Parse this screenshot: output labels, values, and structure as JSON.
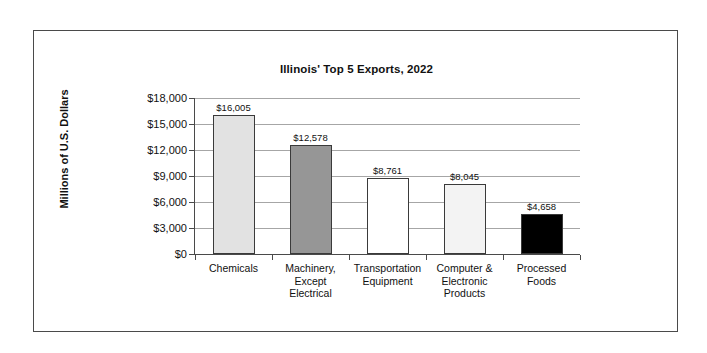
{
  "chart_data": {
    "type": "bar",
    "title": "Illinois' Top 5 Exports, 2022",
    "xlabel": "",
    "ylabel": "Millions of U.S. Dollars",
    "ylim": [
      0,
      18000
    ],
    "ytick_step": 3000,
    "grid": true,
    "legend": "none",
    "categories": [
      "Chemicals",
      "Machinery, Except Electrical",
      "Transportation Equipment",
      "Computer & Electronic Products",
      "Processed Foods"
    ],
    "category_lines": [
      [
        "Chemicals"
      ],
      [
        "Machinery,",
        "Except",
        "Electrical"
      ],
      [
        "Transportation",
        "Equipment"
      ],
      [
        "Computer &",
        "Electronic",
        "Products"
      ],
      [
        "Processed",
        "Foods"
      ]
    ],
    "values": [
      16005,
      12578,
      8761,
      8045,
      4658
    ],
    "value_labels": [
      "$16,005",
      "$12,578",
      "$8,761",
      "$8,045",
      "$4,658"
    ],
    "bar_colors": [
      "#e2e2e2",
      "#969696",
      "#ffffff",
      "#f3f3f3",
      "#000000"
    ],
    "bar_border_color": "#3a3a3a",
    "ytick_labels": [
      "$18,000",
      "$15,000",
      "$12,000",
      "$9,000",
      "$6,000",
      "$3,000",
      "$0"
    ],
    "ytick_values": [
      18000,
      15000,
      12000,
      9000,
      6000,
      3000,
      0
    ],
    "gridline_color": "#a6a6a6",
    "axis_color": "#4a4a4a",
    "frame_color": "#4a4a4a",
    "background": "#ffffff"
  }
}
